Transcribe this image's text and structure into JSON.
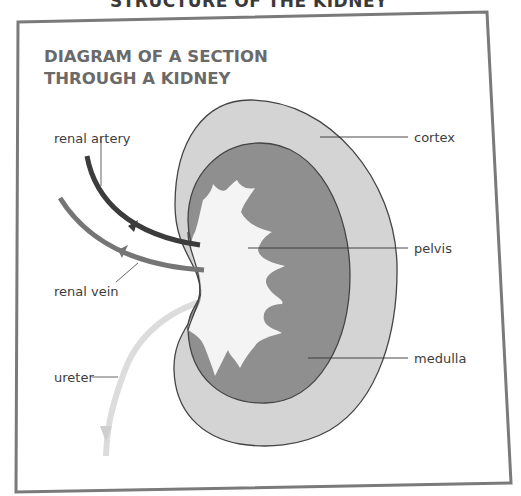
{
  "page": {
    "top_title": "STRUCTURE OF THE KIDNEY"
  },
  "diagram": {
    "title_line1": "DIAGRAM OF A SECTION",
    "title_line2": "THROUGH A KIDNEY",
    "labels": {
      "renal_artery": "renal artery",
      "renal_vein": "renal vein",
      "ureter": "ureter",
      "cortex": "cortex",
      "pelvis": "pelvis",
      "medulla": "medulla"
    },
    "colors": {
      "frame": "#777777",
      "cortex": "#d4d4d4",
      "medulla": "#8f8f8f",
      "pelvis": "#f4f4f4",
      "outline": "#444444",
      "renal_artery": "#3c3c3c",
      "renal_vein": "#757575",
      "ureter": "#dcdcdc",
      "leader_line": "#333333"
    }
  }
}
